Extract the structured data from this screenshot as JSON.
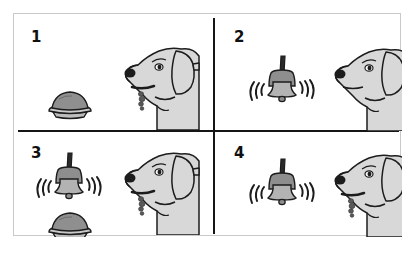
{
  "figure": {
    "background_color": "#ffffff",
    "frame_border_color": "#c9c9c9",
    "divider_color": "#151515"
  },
  "style": {
    "dog_fill": "#d8d8d8",
    "dog_outline": "#1c1c1c",
    "bell_fill": "#b3b3b3",
    "bell_outline": "#1c1c1c",
    "bowl_food_fill": "#8f8f8f",
    "bowl_base_fill": "#bdbdbd",
    "bowl_outline": "#1c1c1c",
    "drool_fill": "#5a5a5a",
    "number_color": "#101010"
  },
  "panels": [
    {
      "number": "1",
      "name": "panel-unconditioned-stimulus",
      "objects": [
        "food-bowl",
        "dog-salivating"
      ],
      "bell_present": false,
      "bowl_present": true,
      "dog_salivating": true,
      "dog_has_collar_tag": true
    },
    {
      "number": "2",
      "name": "panel-neutral-stimulus",
      "objects": [
        "ringing-bell",
        "dog-not-salivating"
      ],
      "bell_present": true,
      "bowl_present": false,
      "dog_salivating": false,
      "dog_has_collar_tag": false
    },
    {
      "number": "3",
      "name": "panel-pairing-stimuli",
      "objects": [
        "ringing-bell",
        "food-bowl",
        "dog-salivating"
      ],
      "bell_present": true,
      "bowl_present": true,
      "dog_salivating": true,
      "dog_has_collar_tag": true
    },
    {
      "number": "4",
      "name": "panel-conditioned-response",
      "objects": [
        "ringing-bell",
        "dog-salivating"
      ],
      "bell_present": true,
      "bowl_present": false,
      "dog_salivating": true,
      "dog_has_collar_tag": true
    }
  ]
}
